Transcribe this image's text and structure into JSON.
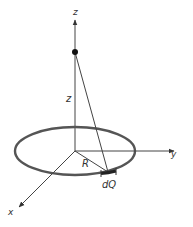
{
  "diagram": {
    "title": "",
    "axes": {
      "z_axis_label": "z",
      "y_axis_label": "y",
      "x_axis_label": "x"
    },
    "labels": {
      "height_label": "z",
      "radius_label": "R",
      "charge_element_label": "dQ"
    },
    "colors": {
      "ring": "#555555",
      "lines": "#333333",
      "text": "#333333",
      "background": "#ffffff"
    }
  }
}
